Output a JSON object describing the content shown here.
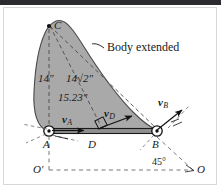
{
  "figure": {
    "type": "mechanics-diagram",
    "caption_label": "Body extended",
    "body_fill_color": "#a9a9a9",
    "body_stroke_color": "#4a4a4a",
    "line_color": "#1a1a1a",
    "dash_color": "#555555",
    "top_bar_color": "#2b2b30",
    "background_color": "#ffffff"
  },
  "points": {
    "A": "A",
    "B": "B",
    "C": "C",
    "D": "D",
    "O": "O",
    "O_prime": "O'"
  },
  "dimensions": {
    "vertical_AC": "14″",
    "diagonal_BC": "14√2″",
    "diagonal_DC": "15.23″"
  },
  "vectors": {
    "vA": {
      "symbol": "v",
      "subscript": "A",
      "direction": "right"
    },
    "vB": {
      "symbol": "v",
      "subscript": "B",
      "direction": "up-right"
    },
    "vD": {
      "symbol": "v",
      "subscript": "D",
      "direction": "up-right"
    }
  },
  "angles": {
    "corner_O": "45°"
  },
  "markers": {
    "right_angle_at_D": "right-angle-square",
    "pin_A": "pin-joint",
    "pin_B": "pin-joint",
    "point_C": "dot-marker"
  }
}
